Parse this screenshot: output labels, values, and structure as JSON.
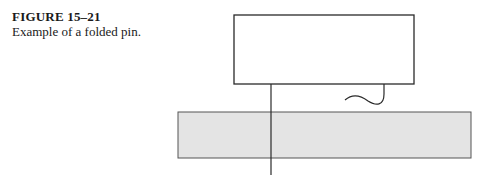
{
  "caption": {
    "figure_number": "FIGURE 15–21",
    "text": "Example of a folded pin."
  },
  "diagram": {
    "component_body": {
      "x": 234,
      "y": 15,
      "width": 180,
      "height": 69,
      "fill": "#ffffff",
      "stroke": "#2a2a2a"
    },
    "circuit_board": {
      "x": 178,
      "y": 112,
      "width": 293,
      "height": 46,
      "fill": "#e4e4e4",
      "stroke": "#555555"
    },
    "straight_pin": {
      "x": 271,
      "y1": 84,
      "y2": 175,
      "stroke": "#2a2a2a"
    },
    "folded_pin": {
      "path": "M384 84 L384 94 C384 106 376 106 368 101 C360 95 352 94 345 100",
      "stroke": "#2a2a2a"
    }
  }
}
